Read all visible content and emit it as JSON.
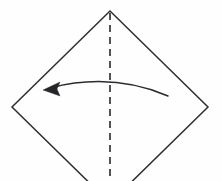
{
  "diagram": {
    "type": "origami-fold-instruction",
    "canvas": {
      "width": 222,
      "height": 181,
      "background_color": "#fefefe"
    },
    "paper": {
      "name": "square-sheet-rotated-45",
      "shape": "diamond",
      "stroke_color": "#2e2e33",
      "stroke_width": 1.5,
      "fill": "none",
      "vertices": {
        "top": [
          110,
          11
        ],
        "right": [
          208,
          107
        ],
        "bottom": [
          110,
          203
        ],
        "left": [
          12,
          107
        ]
      },
      "note": "bottom vertex extends past the lower edge of the frame"
    },
    "fold_line": {
      "name": "vertical-valley-fold-line",
      "style": "dashed",
      "stroke_color": "#35353a",
      "stroke_width": 1.7,
      "dash_pattern": [
        7,
        5
      ],
      "from": [
        110,
        13
      ],
      "to": [
        110,
        181
      ]
    },
    "fold_arrow": {
      "name": "fold-direction-arrow",
      "direction": "right-to-left",
      "stroke_color": "#2b2b30",
      "stroke_width": 1.5,
      "head_fill": "#262629",
      "curve": {
        "start": [
          168,
          96
        ],
        "control": [
          112,
          72
        ],
        "end": [
          50,
          88
        ]
      },
      "arrow_head": {
        "tip": [
          43,
          90
        ],
        "points": "43,90 60,82 57,89 60,96"
      }
    },
    "labels": []
  }
}
